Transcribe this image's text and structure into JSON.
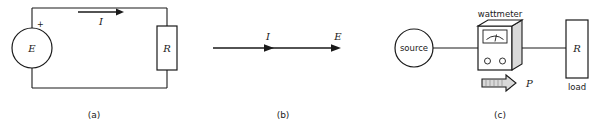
{
  "figure": {
    "background_color": "#ffffff",
    "line_color": "#1a1a1a",
    "shade_color": "#d9d9d9"
  },
  "panels": [
    {
      "id": "a",
      "caption": "(a)",
      "description": "Simple circuit: voltage source E drives current I through resistor R",
      "elements": {
        "source_label": "E",
        "polarity_label": "+",
        "current_label": "I",
        "resistor_label": "R"
      }
    },
    {
      "id": "b",
      "caption": "(b)",
      "description": "Directed line showing current I and voltage E directions",
      "elements": {
        "current_label": "I",
        "emf_label": "E"
      }
    },
    {
      "id": "c",
      "caption": "(c)",
      "description": "Source connected through a wattmeter to a load resistor R; power P flows to the right",
      "elements": {
        "source_label": "source",
        "instrument_label": "wattmeter",
        "power_label": "P",
        "load_resistor_label": "R",
        "load_label": "load"
      }
    }
  ]
}
